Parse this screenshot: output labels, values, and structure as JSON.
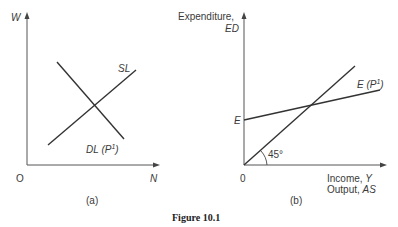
{
  "figure": {
    "caption": "Figure 10.1",
    "panel_a": {
      "label": "(a)",
      "y_axis_label": "W",
      "x_axis_label": "N",
      "origin_label": "O",
      "curves": [
        {
          "name": "SL",
          "label": "SL",
          "description": "labour supply, upward sloping"
        },
        {
          "name": "DL",
          "label": "DL (P¹)",
          "label_main": "DL (P",
          "label_sup": "1",
          "label_end": ")",
          "description": "labour demand at price level P1, downward sloping"
        }
      ]
    },
    "panel_b": {
      "label": "(b)",
      "y_axis_label_line1": "Expenditure,",
      "y_axis_label_line2": "ED",
      "x_axis_label_line1": "Income, Y",
      "x_axis_label_line1_main": "Income, ",
      "x_axis_label_line1_var": "Y",
      "x_axis_label_line2_main": "Output, ",
      "x_axis_label_line2_var": "AS",
      "origin_label": "0",
      "intercept_label": "E",
      "angle_label": "45°",
      "curves": [
        {
          "name": "E",
          "label_main": "E (P",
          "label_sup": "1",
          "label_end": ")",
          "description": "expenditure line at price level P1 with intercept E"
        },
        {
          "name": "45-degree",
          "description": "45-degree line from origin"
        }
      ]
    }
  }
}
